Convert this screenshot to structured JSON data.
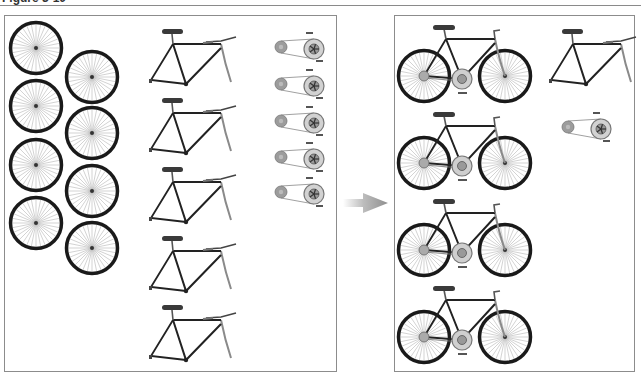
{
  "figure": {
    "caption": "Figure 3-10"
  },
  "left_panel": {
    "label": "Parts",
    "wheels": [
      {
        "cx": 36,
        "cy": 48
      },
      {
        "cx": 92,
        "cy": 77
      },
      {
        "cx": 36,
        "cy": 106
      },
      {
        "cx": 92,
        "cy": 133
      },
      {
        "cx": 36,
        "cy": 165
      },
      {
        "cx": 92,
        "cy": 191
      },
      {
        "cx": 36,
        "cy": 223
      },
      {
        "cx": 92,
        "cy": 248
      }
    ],
    "frames_top_y": [
      20,
      89,
      158,
      227,
      296
    ],
    "drivetrains_y": [
      47,
      84,
      121,
      157,
      192
    ]
  },
  "arrow": {
    "x1": 343,
    "x2": 388,
    "y": 203,
    "color": "#9a9a9a"
  },
  "right_panel": {
    "label": "Assembled bicycles",
    "bikes_top_y": [
      23,
      110,
      197,
      284
    ],
    "spare_frame": {
      "x": 540,
      "y": 20
    },
    "spare_drivetrain": {
      "x": 568,
      "y": 127
    }
  },
  "colors": {
    "tire": "#1a1a1a",
    "spoke": "#b5b5b5",
    "frame": "#222222",
    "saddle": "#3a3a3a",
    "fork": "#8a8a8a",
    "drivetrain": "#9c9c9c",
    "border": "#8c8c8c"
  }
}
